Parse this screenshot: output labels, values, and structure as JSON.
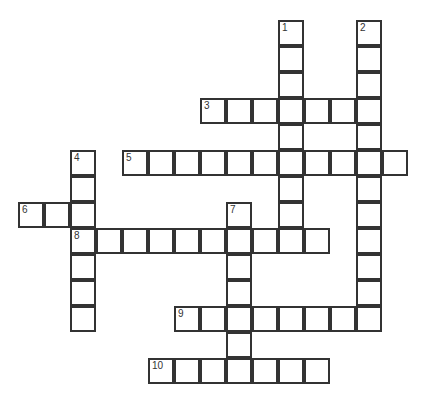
{
  "puzzle": {
    "type": "crossword-grid",
    "title": "",
    "cell_size": 26,
    "origin_x": 18,
    "origin_y": 20,
    "grid_cols": 16,
    "grid_rows": 15,
    "colors": {
      "background": "#ffffff",
      "cell_fill": "#ffffff",
      "cell_border": "#333333",
      "number_text": "#333333"
    },
    "entries": [
      {
        "number": "1",
        "direction": "down",
        "col": 10,
        "row": 0,
        "length": 9
      },
      {
        "number": "2",
        "direction": "down",
        "col": 13,
        "row": 0,
        "length": 12
      },
      {
        "number": "3",
        "direction": "across",
        "col": 7,
        "row": 3,
        "length": 7
      },
      {
        "number": "4",
        "direction": "down",
        "col": 2,
        "row": 5,
        "length": 7
      },
      {
        "number": "5",
        "direction": "across",
        "col": 4,
        "row": 5,
        "length": 11
      },
      {
        "number": "6",
        "direction": "across",
        "col": 0,
        "row": 7,
        "length": 3
      },
      {
        "number": "7",
        "direction": "down",
        "col": 8,
        "row": 7,
        "length": 7
      },
      {
        "number": "8",
        "direction": "across",
        "col": 2,
        "row": 8,
        "length": 10
      },
      {
        "number": "9",
        "direction": "across",
        "col": 6,
        "row": 11,
        "length": 8
      },
      {
        "number": "10",
        "direction": "across",
        "col": 5,
        "row": 13,
        "length": 7
      }
    ],
    "numbered_cells": [
      {
        "label": "1",
        "col": 10,
        "row": 0
      },
      {
        "label": "2",
        "col": 13,
        "row": 0
      },
      {
        "label": "3",
        "col": 7,
        "row": 3
      },
      {
        "label": "4",
        "col": 2,
        "row": 5
      },
      {
        "label": "5",
        "col": 4,
        "row": 5
      },
      {
        "label": "6",
        "col": 0,
        "row": 7
      },
      {
        "label": "7",
        "col": 8,
        "row": 7
      },
      {
        "label": "8",
        "col": 2,
        "row": 8
      },
      {
        "label": "9",
        "col": 6,
        "row": 11
      },
      {
        "label": "10",
        "col": 5,
        "row": 13
      }
    ]
  }
}
